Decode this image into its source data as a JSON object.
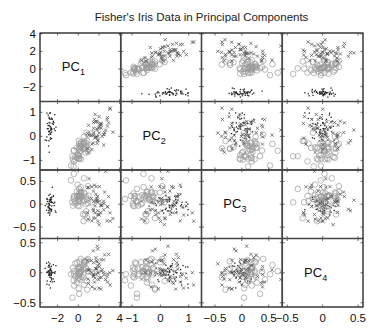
{
  "chart_data": {
    "type": "scatter",
    "subtype": "scatter-matrix",
    "title": "Fisher's Iris Data in Principal Components",
    "variables": [
      "PC1",
      "PC2",
      "PC3",
      "PC4"
    ],
    "diagonal_labels": [
      {
        "base": "PC",
        "sub": "1"
      },
      {
        "base": "PC",
        "sub": "2"
      },
      {
        "base": "PC",
        "sub": "3"
      },
      {
        "base": "PC",
        "sub": "4"
      }
    ],
    "axis_ranges": {
      "PC1": [
        -3.7,
        4.1
      ],
      "PC2": [
        -1.4,
        1.45
      ],
      "PC3": [
        -0.75,
        0.75
      ],
      "PC4": [
        -0.57,
        0.57
      ]
    },
    "y_tick_labels": {
      "PC1": [
        "4",
        "2",
        "0",
        "−2"
      ],
      "PC2": [
        "1",
        "0",
        "−1"
      ],
      "PC3": [
        "0.5",
        "0",
        "−0.5"
      ],
      "PC4": [
        "0.5",
        "0",
        "−0.5"
      ]
    },
    "y_tick_values": {
      "PC1": [
        4,
        2,
        0,
        -2
      ],
      "PC2": [
        1,
        0,
        -1
      ],
      "PC3": [
        0.5,
        0,
        -0.5
      ],
      "PC4": [
        0.5,
        0,
        -0.5
      ]
    },
    "x_tick_labels": {
      "PC1": [
        "−2",
        "0",
        "2",
        "4"
      ],
      "PC2": [
        "−1",
        "0",
        "1"
      ],
      "PC3": [
        "−0.5",
        "0",
        "0.5"
      ],
      "PC4": [
        "−0.5",
        "0",
        "0.5"
      ]
    },
    "x_tick_values": {
      "PC1": [
        -2,
        0,
        2,
        4
      ],
      "PC2": [
        -1,
        0,
        1
      ],
      "PC3": [
        -0.5,
        0,
        0.5
      ],
      "PC4": [
        -0.5,
        0,
        0.5
      ]
    },
    "legend": null,
    "grid": false,
    "series": [
      {
        "name": "setosa",
        "marker": "dot",
        "color": "#222222",
        "n": 50,
        "mean": [
          -2.7,
          0.32,
          0.0,
          0.0
        ],
        "sd": [
          0.2,
          0.35,
          0.12,
          0.1
        ]
      },
      {
        "name": "versicolor",
        "marker": "circle",
        "color": "#9a9a9a",
        "n": 50,
        "mean": [
          0.3,
          -0.5,
          0.05,
          -0.02
        ],
        "sd": [
          0.5,
          0.33,
          0.2,
          0.15
        ]
      },
      {
        "name": "virginica",
        "marker": "x",
        "color": "#555555",
        "n": 50,
        "mean": [
          1.95,
          0.2,
          -0.05,
          0.02
        ],
        "sd": [
          0.6,
          0.4,
          0.25,
          0.18
        ]
      }
    ],
    "correlation_pc1_pc2": {
      "versicolor": 0.55,
      "virginica": 0.5
    },
    "seed": 7
  }
}
